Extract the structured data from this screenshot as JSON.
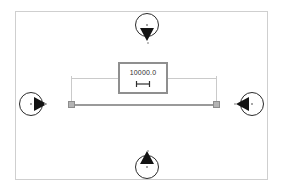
{
  "viewport": {
    "name": "cad-measure-viewport",
    "background_color": "#ffffff",
    "frame_color": "#cfcfcf"
  },
  "dimension": {
    "value": "10000.0",
    "icon": "linear-dimension-icon",
    "line_color": "#9a9a9a",
    "witness_color": "#cacaca",
    "grip_color": "#b4b4b4",
    "label_border_color": "#8f8f8f"
  },
  "markers": [
    {
      "id": "top",
      "name": "view-marker-top",
      "direction": "down",
      "label": ""
    },
    {
      "id": "bottom",
      "name": "view-marker-bottom",
      "direction": "up",
      "label": ""
    },
    {
      "id": "left",
      "name": "view-marker-left",
      "direction": "right",
      "label": ""
    },
    {
      "id": "right",
      "name": "view-marker-right",
      "direction": "left",
      "label": ""
    }
  ]
}
